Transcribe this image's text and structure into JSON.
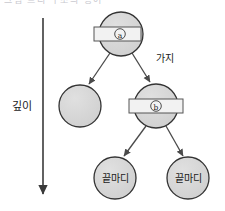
{
  "figure": {
    "title_clipped": "그림 트리 구조의 용어",
    "background_color": "#ffffff",
    "width": 225,
    "height": 211
  },
  "style": {
    "node_fill": "#d4d4d4",
    "node_stroke": "#333333",
    "band_fill": "#f2f2f2",
    "band_stroke": "#555555",
    "edge_color": "#4a4a4a",
    "axis_color": "#3a3a3a",
    "text_color": "#1a1a1a"
  },
  "depth_axis": {
    "label": "깊이",
    "label_x": 22,
    "label_y": 106,
    "arrow_x": 43,
    "arrow_y_start": 18,
    "arrow_y_end": 196,
    "direction": "down"
  },
  "nodes": [
    {
      "id": "root",
      "name": "root-node-a",
      "cx": 121,
      "cy": 34,
      "r": 22,
      "band": true,
      "band_x": 94,
      "band_y": 27,
      "band_w": 47,
      "band_h": 14,
      "badge_label": "a",
      "label": ""
    },
    {
      "id": "leftchild",
      "name": "plain-node",
      "cx": 80,
      "cy": 106,
      "r": 21,
      "band": false,
      "badge_label": "",
      "label": ""
    },
    {
      "id": "nodeb",
      "name": "node-b",
      "cx": 156,
      "cy": 106,
      "r": 22,
      "band": true,
      "band_x": 129,
      "band_y": 99,
      "band_w": 54,
      "band_h": 14,
      "badge_label": "b",
      "label": ""
    },
    {
      "id": "leaf1",
      "name": "leaf-node-left",
      "cx": 115,
      "cy": 178,
      "r": 21,
      "band": false,
      "badge_label": "",
      "label": "끝마디"
    },
    {
      "id": "leaf2",
      "name": "leaf-node-right",
      "cx": 188,
      "cy": 178,
      "r": 21,
      "band": false,
      "badge_label": "",
      "label": "끝마디"
    }
  ],
  "edges": [
    {
      "from": "root",
      "to": "leftchild",
      "x1": 110,
      "y1": 53,
      "x2": 88,
      "y2": 85,
      "label": ""
    },
    {
      "from": "root",
      "to": "nodeb",
      "x1": 132,
      "y1": 53,
      "x2": 150,
      "y2": 83,
      "label": "가지",
      "label_x": 156,
      "label_y": 59
    },
    {
      "from": "nodeb",
      "to": "leaf1",
      "x1": 146,
      "y1": 126,
      "x2": 123,
      "y2": 157,
      "label": ""
    },
    {
      "from": "nodeb",
      "to": "leaf2",
      "x1": 166,
      "y1": 126,
      "x2": 182,
      "y2": 157,
      "label": ""
    }
  ],
  "labels": {
    "branch": "가지",
    "depth": "깊이",
    "leaf": "끝마디",
    "badge_a": "a",
    "badge_b": "b"
  }
}
